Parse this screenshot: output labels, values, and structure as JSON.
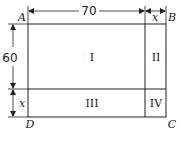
{
  "diagram": {
    "corners": {
      "top_left": "A",
      "top_right": "B",
      "bottom_right": "C",
      "bottom_left": "D"
    },
    "regions": [
      "I",
      "II",
      "III",
      "IV"
    ],
    "dimensions": {
      "top_width": "70",
      "top_extra": "x",
      "left_height": "60",
      "left_extra": "x"
    },
    "stroke_color": "#222222",
    "background": "#ffffff"
  }
}
